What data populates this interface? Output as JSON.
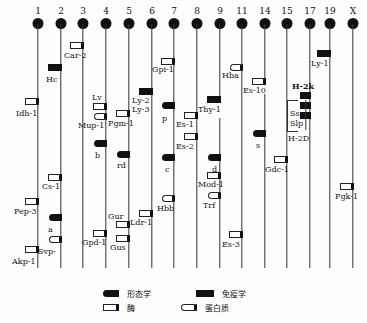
{
  "chromosomes": [
    {
      "id": "1",
      "x": 38
    },
    {
      "id": "2",
      "x": 61
    },
    {
      "id": "3",
      "x": 83
    },
    {
      "id": "4",
      "x": 106
    },
    {
      "id": "5",
      "x": 129
    },
    {
      "id": "6",
      "x": 152
    },
    {
      "id": "7",
      "x": 174
    },
    {
      "id": "8",
      "x": 197
    },
    {
      "id": "9",
      "x": 220
    },
    {
      "id": "11",
      "x": 242
    },
    {
      "id": "14",
      "x": 265
    },
    {
      "id": "15",
      "x": 287
    },
    {
      "id": "17",
      "x": 310
    },
    {
      "id": "19",
      "x": 330
    },
    {
      "id": "X",
      "x": 353
    }
  ],
  "line_top": 24,
  "line_bottom": 268,
  "markers": [
    {
      "name": "Car-2",
      "chr": "3",
      "type": "enzyme",
      "y": 42,
      "side": "left",
      "lx": 64,
      "ly": 52
    },
    {
      "name": "Hc",
      "chr": "2",
      "type": "immune",
      "y": 64,
      "side": "left",
      "lx": 46,
      "ly": 76
    },
    {
      "name": "Idh-1",
      "chr": "1",
      "type": "enzyme",
      "y": 98,
      "side": "left",
      "lx": 16,
      "ly": 110
    },
    {
      "name": "Lv",
      "chr": "4",
      "type": "enzyme",
      "y": 103,
      "side": "left",
      "lx": 92,
      "ly": 94
    },
    {
      "name": "Mup-1",
      "chr": "4",
      "type": "protein",
      "y": 113,
      "side": "left",
      "lx": 78,
      "ly": 122
    },
    {
      "name": "Pgm-1",
      "chr": "5",
      "type": "enzyme",
      "y": 110,
      "side": "left",
      "lx": 108,
      "ly": 120
    },
    {
      "name": "Ly-2",
      "chr": "6",
      "type": "immune",
      "y": 88,
      "side": "left",
      "lx": 132,
      "ly": 97
    },
    {
      "name": "Ly-3",
      "chr": "6",
      "type": "text",
      "lx": 132,
      "ly": 106
    },
    {
      "name": "Gpi-1",
      "chr": "7",
      "type": "enzyme",
      "y": 58,
      "side": "left",
      "lx": 152,
      "ly": 66
    },
    {
      "name": "p",
      "chr": "7",
      "type": "morph",
      "y": 102,
      "side": "left",
      "lx": 162,
      "ly": 115
    },
    {
      "name": "b",
      "chr": "4",
      "type": "morph",
      "y": 140,
      "side": "left",
      "lx": 95,
      "ly": 152
    },
    {
      "name": "rd",
      "chr": "5",
      "type": "morph",
      "y": 151,
      "side": "left",
      "lx": 117,
      "ly": 162
    },
    {
      "name": "Es-1",
      "chr": "8",
      "type": "enzyme",
      "y": 112,
      "side": "left",
      "lx": 176,
      "ly": 121
    },
    {
      "name": "Es-2",
      "chr": "8",
      "type": "enzyme",
      "y": 133,
      "side": "left",
      "lx": 176,
      "ly": 143
    },
    {
      "name": "c",
      "chr": "7",
      "type": "morph",
      "y": 154,
      "side": "left",
      "lx": 165,
      "ly": 166
    },
    {
      "name": "Thy-1",
      "chr": "9",
      "type": "immune",
      "y": 96,
      "side": "left",
      "lx": 198,
      "ly": 106
    },
    {
      "name": "d",
      "chr": "9",
      "type": "morph",
      "y": 154,
      "side": "left",
      "lx": 212,
      "ly": 166
    },
    {
      "name": "Mod-1",
      "chr": "9",
      "type": "enzyme",
      "y": 172,
      "side": "left",
      "lx": 198,
      "ly": 181
    },
    {
      "name": "Trf",
      "chr": "9",
      "type": "protein",
      "y": 192,
      "side": "left",
      "lx": 203,
      "ly": 202
    },
    {
      "name": "Hba",
      "chr": "11",
      "type": "protein",
      "y": 64,
      "side": "left",
      "lx": 222,
      "ly": 72
    },
    {
      "name": "Es-10",
      "chr": "14",
      "type": "enzyme",
      "y": 78,
      "side": "left",
      "lx": 243,
      "ly": 87
    },
    {
      "name": "s",
      "chr": "14",
      "type": "morph",
      "y": 130,
      "side": "left",
      "lx": 256,
      "ly": 142
    },
    {
      "name": "Gdc-1",
      "chr": "15",
      "type": "enzyme",
      "y": 156,
      "side": "left",
      "lx": 265,
      "ly": 166
    },
    {
      "name": "Ly-1",
      "chr": "19",
      "type": "immune",
      "y": 50,
      "side": "left",
      "lx": 311,
      "ly": 60
    },
    {
      "name": "Pgk-1",
      "chr": "X",
      "type": "enzyme",
      "y": 183,
      "side": "left",
      "lx": 335,
      "ly": 193
    },
    {
      "name": "Cs-1",
      "chr": "2",
      "type": "enzyme",
      "y": 174,
      "side": "left",
      "lx": 42,
      "ly": 183
    },
    {
      "name": "Pep-3",
      "chr": "1",
      "type": "enzyme",
      "y": 198,
      "side": "left",
      "lx": 14,
      "ly": 208
    },
    {
      "name": "a",
      "chr": "2",
      "type": "morph",
      "y": 214,
      "side": "left",
      "lx": 48,
      "ly": 226
    },
    {
      "name": "Svp-",
      "chr": "2",
      "type": "protein",
      "y": 236,
      "side": "left",
      "lx": 38,
      "ly": 248
    },
    {
      "name": "Akp-1",
      "chr": "1",
      "type": "enzyme",
      "y": 246,
      "side": "left",
      "lx": 12,
      "ly": 258
    },
    {
      "name": "Gpd-1",
      "chr": "4",
      "type": "enzyme",
      "y": 230,
      "side": "left",
      "lx": 82,
      "ly": 239
    },
    {
      "name": "Gur",
      "chr": "5",
      "type": "enzyme",
      "y": 221,
      "side": "left",
      "lx": 108,
      "ly": 213
    },
    {
      "name": "Gus",
      "chr": "5",
      "type": "enzyme",
      "y": 235,
      "side": "left",
      "lx": 110,
      "ly": 244
    },
    {
      "name": "Ldr-1",
      "chr": "6",
      "type": "enzyme",
      "y": 210,
      "side": "left",
      "lx": 130,
      "ly": 219
    },
    {
      "name": "Hbb",
      "chr": "7",
      "type": "protein",
      "y": 195,
      "side": "left",
      "lx": 157,
      "ly": 205
    },
    {
      "name": "Es-3",
      "chr": "11",
      "type": "enzyme",
      "y": 231,
      "side": "left",
      "lx": 222,
      "ly": 241
    }
  ],
  "h2_complex": {
    "chr": "17",
    "top_label": "H-2k",
    "bars_y": [
      92,
      102,
      112
    ],
    "inner_labels": [
      "Ss",
      "Slp"
    ],
    "bottom_label": "H-2D"
  },
  "legend": [
    {
      "type": "morph",
      "label": "形态学",
      "x": 103,
      "y": 288
    },
    {
      "type": "immune",
      "label": "免疫学",
      "x": 196,
      "y": 288
    },
    {
      "type": "enzyme",
      "label": "酶",
      "x": 103,
      "y": 302
    },
    {
      "type": "protein",
      "label": "蛋白质",
      "x": 181,
      "y": 302
    }
  ]
}
